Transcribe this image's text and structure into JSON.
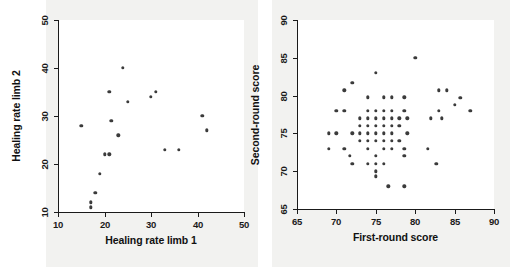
{
  "figure": {
    "background": "#ffffff",
    "panel_background": "#f2f2f0",
    "plot_background": "#ffffff",
    "point_color": "#3b3b3b",
    "axis_color": "#1a1a1a"
  },
  "chart_data": [
    {
      "type": "scatter",
      "id": "healing-rate",
      "title": "",
      "xlabel": "Healing rate limb 1",
      "ylabel": "Healing rate limb 2",
      "xlim": [
        10,
        50
      ],
      "ylim": [
        10,
        50
      ],
      "xticks": [
        10,
        20,
        30,
        40,
        50
      ],
      "yticks": [
        10,
        20,
        30,
        40,
        50
      ],
      "grid": false,
      "legend": null,
      "points": [
        [
          15,
          28
        ],
        [
          17,
          12
        ],
        [
          17,
          11
        ],
        [
          18,
          14
        ],
        [
          19,
          18
        ],
        [
          20,
          22
        ],
        [
          21,
          22
        ],
        [
          21,
          35
        ],
        [
          21.5,
          29
        ],
        [
          23,
          26
        ],
        [
          24,
          40
        ],
        [
          25,
          33
        ],
        [
          30,
          34
        ],
        [
          31,
          35
        ],
        [
          33,
          23
        ],
        [
          36,
          23
        ],
        [
          41,
          30
        ],
        [
          42,
          27
        ]
      ]
    },
    {
      "type": "scatter",
      "id": "round-scores",
      "title": "",
      "xlabel": "First-round score",
      "ylabel": "Second-round score",
      "xlim": [
        65,
        90
      ],
      "ylim": [
        65,
        90
      ],
      "xticks": [
        65,
        70,
        75,
        80,
        85,
        90
      ],
      "yticks": [
        65,
        70,
        75,
        80,
        85,
        90
      ],
      "grid": false,
      "legend": null,
      "points": [
        [
          80,
          85
        ],
        [
          75,
          83
        ],
        [
          72,
          81.7
        ],
        [
          71,
          80.7
        ],
        [
          83,
          80.7
        ],
        [
          84,
          80.7
        ],
        [
          74,
          79.8
        ],
        [
          76,
          79.8
        ],
        [
          77,
          79.8
        ],
        [
          78.6,
          79.8
        ],
        [
          85.7,
          79.7
        ],
        [
          85,
          78.8
        ],
        [
          70,
          78
        ],
        [
          71,
          78
        ],
        [
          74,
          78
        ],
        [
          75,
          78
        ],
        [
          76,
          78
        ],
        [
          77,
          78
        ],
        [
          78.6,
          78
        ],
        [
          83,
          78
        ],
        [
          87,
          78
        ],
        [
          73,
          77
        ],
        [
          74,
          77
        ],
        [
          75,
          77
        ],
        [
          76,
          77
        ],
        [
          77,
          77
        ],
        [
          78,
          77
        ],
        [
          79,
          77
        ],
        [
          82,
          77
        ],
        [
          83.4,
          77
        ],
        [
          73,
          76
        ],
        [
          74,
          76
        ],
        [
          75,
          76
        ],
        [
          76,
          76
        ],
        [
          77,
          76
        ],
        [
          78,
          76
        ],
        [
          69,
          75
        ],
        [
          70,
          75
        ],
        [
          72,
          75
        ],
        [
          73,
          75
        ],
        [
          74,
          75
        ],
        [
          75,
          75
        ],
        [
          76,
          75
        ],
        [
          77,
          75
        ],
        [
          79,
          75
        ],
        [
          73,
          74
        ],
        [
          74,
          74
        ],
        [
          75,
          74
        ],
        [
          76,
          74
        ],
        [
          77,
          74
        ],
        [
          78,
          74
        ],
        [
          69,
          73
        ],
        [
          71,
          73
        ],
        [
          74,
          73
        ],
        [
          76,
          73
        ],
        [
          77,
          73
        ],
        [
          78.6,
          73
        ],
        [
          81.6,
          73
        ],
        [
          71.7,
          72
        ],
        [
          75,
          72
        ],
        [
          78.6,
          72
        ],
        [
          72,
          71
        ],
        [
          74,
          71
        ],
        [
          75,
          71
        ],
        [
          76,
          71
        ],
        [
          82.7,
          71
        ],
        [
          75,
          70
        ],
        [
          75,
          69.3
        ],
        [
          76.6,
          68
        ],
        [
          78.6,
          68
        ]
      ]
    }
  ]
}
